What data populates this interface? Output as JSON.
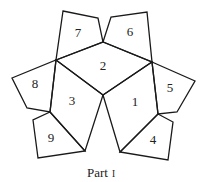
{
  "diagram": {
    "caption": {
      "text": "Part",
      "numeral": "I"
    },
    "stroke_color": "#1a1a1a",
    "faces": [
      {
        "id": "1",
        "label": "1",
        "label_pos": [
          135,
          103
        ],
        "points": [
          [
            103,
            95
          ],
          [
            152,
            62
          ],
          [
            158,
            114
          ],
          [
            120,
            152
          ]
        ]
      },
      {
        "id": "2",
        "label": "2",
        "label_pos": [
          103,
          67
        ],
        "points": [
          [
            56,
            60
          ],
          [
            103,
            42
          ],
          [
            152,
            62
          ],
          [
            103,
            95
          ]
        ]
      },
      {
        "id": "3",
        "label": "3",
        "label_pos": [
          72,
          102
        ],
        "points": [
          [
            56,
            60
          ],
          [
            103,
            95
          ],
          [
            85,
            151
          ],
          [
            50,
            112
          ]
        ]
      },
      {
        "id": "4",
        "label": "4",
        "label_pos": [
          153,
          141
        ],
        "points": [
          [
            158,
            114
          ],
          [
            173,
            122
          ],
          [
            168,
            160
          ],
          [
            120,
            152
          ]
        ]
      },
      {
        "id": "5",
        "label": "5",
        "label_pos": [
          170,
          89
        ],
        "points": [
          [
            152,
            62
          ],
          [
            195,
            81
          ],
          [
            177,
            112
          ],
          [
            158,
            114
          ]
        ]
      },
      {
        "id": "6",
        "label": "6",
        "label_pos": [
          130,
          33
        ],
        "points": [
          [
            103,
            42
          ],
          [
            111,
            17
          ],
          [
            147,
            12
          ],
          [
            152,
            62
          ]
        ]
      },
      {
        "id": "7",
        "label": "7",
        "label_pos": [
          78,
          34
        ],
        "points": [
          [
            63,
            11
          ],
          [
            98,
            18
          ],
          [
            103,
            42
          ],
          [
            56,
            60
          ]
        ]
      },
      {
        "id": "8",
        "label": "8",
        "label_pos": [
          35,
          85
        ],
        "points": [
          [
            56,
            60
          ],
          [
            50,
            112
          ],
          [
            27,
            108
          ],
          [
            12,
            78
          ]
        ]
      },
      {
        "id": "9",
        "label": "9",
        "label_pos": [
          51,
          139
        ],
        "points": [
          [
            50,
            112
          ],
          [
            85,
            151
          ],
          [
            38,
            158
          ],
          [
            33,
            120
          ]
        ]
      }
    ]
  }
}
